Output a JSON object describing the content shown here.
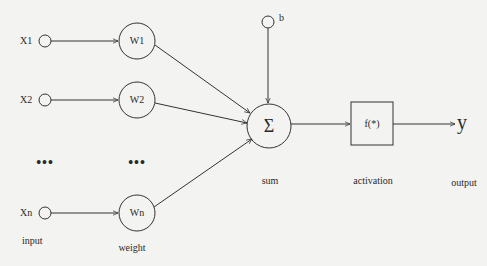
{
  "diagram": {
    "title": "",
    "inputs": [
      {
        "label": "X1",
        "weight": "W1"
      },
      {
        "label": "X2",
        "weight": "W2"
      },
      {
        "label": "Xn",
        "weight": "Wn"
      }
    ],
    "ellipsis": "•••",
    "bias": "b",
    "sum_symbol": "Σ",
    "activation_function": "f(*)",
    "output_symbol": "y",
    "captions": {
      "input": "input",
      "weight": "weight",
      "sum": "sum",
      "activation": "activation",
      "output": "output"
    },
    "colors": {
      "background": "#f3f3f1",
      "stroke": "#333333"
    }
  }
}
